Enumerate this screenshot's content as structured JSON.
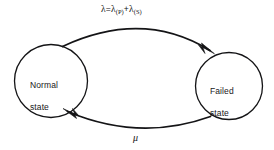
{
  "diagram": {
    "type": "state-transition-diagram",
    "background_color": "#ffffff",
    "stroke_color": "#141416",
    "text_color": "#18181a",
    "states": [
      {
        "id": "normal",
        "label": "Normal\nstate",
        "label_line_1": "Normal",
        "label_line_2": "state",
        "shape": "circle",
        "center_x": 51,
        "center_y": 81,
        "radius": 36.5
      },
      {
        "id": "failed",
        "label": "Failed\nstate",
        "label_line_1": "Failed",
        "label_line_2": "state",
        "shape": "circle",
        "center_x": 229,
        "center_y": 86,
        "radius": 33.5
      }
    ],
    "transitions": [
      {
        "id": "failure-rate",
        "from": "normal",
        "to": "failed",
        "direction": "left-to-right",
        "arc_position": "top",
        "arrowhead": "filled-triangle",
        "label_plain": "λ = λ(P) + λ(S)",
        "label_parts": {
          "lambda": "λ",
          "equals": "=",
          "lambda_p": "λ",
          "sub_p": "(P)",
          "plus": "+",
          "lambda_s": "λ",
          "sub_s": "(S)"
        }
      },
      {
        "id": "repair-rate",
        "from": "failed",
        "to": "normal",
        "direction": "right-to-left",
        "arc_position": "bottom",
        "arrowhead": "filled-triangle",
        "label_plain": "μ",
        "label_parts": {
          "mu": "μ"
        }
      }
    ]
  }
}
